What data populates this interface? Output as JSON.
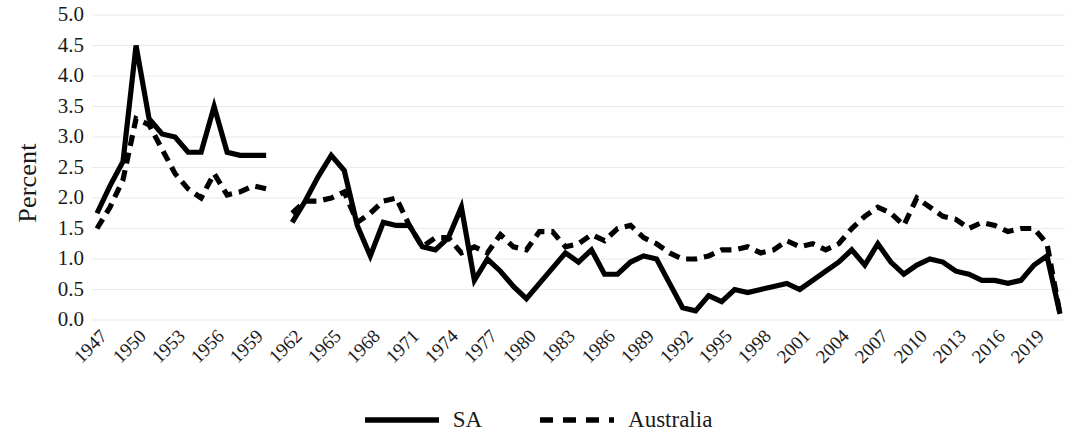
{
  "chart_data": {
    "type": "line",
    "title": "",
    "subtitle": "",
    "xlabel": "",
    "ylabel": "Percent",
    "ylim": [
      0.0,
      5.0
    ],
    "xlim": [
      1947,
      2021
    ],
    "y_ticks": [
      "0.0",
      "0.5",
      "1.0",
      "1.5",
      "2.0",
      "2.5",
      "3.0",
      "3.5",
      "4.0",
      "4.5",
      "5.0"
    ],
    "y_tick_values": [
      0.0,
      0.5,
      1.0,
      1.5,
      2.0,
      2.5,
      3.0,
      3.5,
      4.0,
      4.5,
      5.0
    ],
    "x_tick_labels": [
      "1947",
      "1950",
      "1953",
      "1956",
      "1959",
      "1962",
      "1965",
      "1968",
      "1971",
      "1974",
      "1977",
      "1980",
      "1983",
      "1986",
      "1989",
      "1992",
      "1995",
      "1998",
      "2001",
      "2004",
      "2007",
      "2010",
      "2013",
      "2016",
      "2019"
    ],
    "x_tick_values": [
      1947,
      1950,
      1953,
      1956,
      1959,
      1962,
      1965,
      1968,
      1971,
      1974,
      1977,
      1980,
      1983,
      1986,
      1989,
      1992,
      1995,
      1998,
      2001,
      2004,
      2007,
      2010,
      2013,
      2016,
      2019
    ],
    "grid": true,
    "grid_axis": "y",
    "grid_color": "#e9e9e9",
    "legend_position": "bottom",
    "line_color": "#000000",
    "x": [
      1947,
      1948,
      1949,
      1950,
      1951,
      1952,
      1953,
      1954,
      1955,
      1956,
      1957,
      1958,
      1959,
      1960,
      1962,
      1963,
      1964,
      1965,
      1966,
      1967,
      1968,
      1969,
      1970,
      1971,
      1972,
      1973,
      1974,
      1975,
      1976,
      1977,
      1978,
      1979,
      1980,
      1981,
      1982,
      1983,
      1984,
      1985,
      1986,
      1987,
      1988,
      1989,
      1990,
      1991,
      1992,
      1993,
      1994,
      1995,
      1996,
      1997,
      1998,
      1999,
      2000,
      2001,
      2002,
      2003,
      2004,
      2005,
      2006,
      2007,
      2008,
      2009,
      2010,
      2011,
      2012,
      2013,
      2014,
      2015,
      2016,
      2017,
      2018,
      2019,
      2020,
      2021
    ],
    "series": [
      {
        "name": "SA",
        "style": "solid",
        "color": "#000000",
        "values": [
          1.75,
          2.2,
          2.6,
          4.5,
          3.3,
          3.05,
          3.0,
          2.75,
          2.75,
          3.5,
          2.75,
          2.7,
          2.7,
          2.7,
          1.6,
          1.95,
          2.35,
          2.7,
          2.45,
          1.55,
          1.05,
          1.6,
          1.55,
          1.55,
          1.2,
          1.15,
          1.35,
          1.85,
          0.65,
          1.0,
          0.8,
          0.55,
          0.35,
          0.6,
          0.85,
          1.1,
          0.95,
          1.15,
          0.75,
          0.75,
          0.95,
          1.05,
          1.0,
          0.6,
          0.2,
          0.15,
          0.4,
          0.3,
          0.5,
          0.45,
          0.5,
          0.55,
          0.6,
          0.5,
          0.65,
          0.8,
          0.95,
          1.15,
          0.9,
          1.25,
          0.95,
          0.75,
          0.9,
          1.0,
          0.95,
          0.8,
          0.75,
          0.65,
          0.65,
          0.6,
          0.65,
          0.9,
          1.05,
          0.1
        ]
      },
      {
        "name": "Australia",
        "style": "dashed",
        "color": "#000000",
        "values": [
          1.5,
          1.85,
          2.3,
          3.3,
          3.2,
          2.8,
          2.4,
          2.15,
          2.0,
          2.4,
          2.05,
          2.1,
          2.2,
          2.15,
          1.75,
          1.95,
          1.95,
          2.0,
          2.1,
          1.6,
          1.75,
          1.95,
          2.0,
          1.55,
          1.2,
          1.35,
          1.35,
          1.1,
          1.2,
          1.1,
          1.4,
          1.2,
          1.15,
          1.45,
          1.45,
          1.2,
          1.25,
          1.4,
          1.3,
          1.5,
          1.55,
          1.35,
          1.25,
          1.1,
          1.0,
          1.0,
          1.05,
          1.15,
          1.15,
          1.2,
          1.1,
          1.15,
          1.3,
          1.2,
          1.25,
          1.15,
          1.25,
          1.5,
          1.7,
          1.85,
          1.75,
          1.55,
          2.0,
          1.85,
          1.7,
          1.65,
          1.5,
          1.6,
          1.55,
          1.45,
          1.5,
          1.5,
          1.25,
          0.1
        ]
      }
    ]
  },
  "legend": {
    "items": [
      {
        "label": "SA",
        "style": "solid"
      },
      {
        "label": "Australia",
        "style": "dashed"
      }
    ]
  }
}
